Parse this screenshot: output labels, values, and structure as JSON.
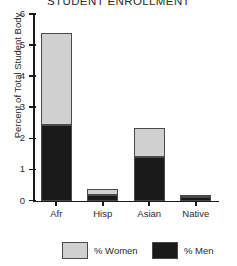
{
  "chart_data": {
    "type": "bar",
    "subtype": "stacked",
    "title": "STUDENT ENROLLMENT",
    "xlabel": "",
    "ylabel": "Percent of Total Student Body",
    "categories": [
      "Afr",
      "Hisp",
      "Asian",
      "Native"
    ],
    "series": [
      {
        "name": "% Men",
        "color": "#1a1a1a",
        "values": [
          2.43,
          0.19,
          1.41,
          0.12
        ]
      },
      {
        "name": "% Women",
        "color": "#d0d0d0",
        "values": [
          2.97,
          0.19,
          0.92,
          0.04
        ]
      }
    ],
    "totals": [
      5.4,
      0.38,
      2.33,
      0.16
    ],
    "stack_order": [
      "% Men",
      "% Women"
    ],
    "ylim": [
      0,
      6
    ],
    "yticks": [
      0,
      1,
      2,
      3,
      4,
      5,
      6
    ],
    "ytick_labels": [
      "0",
      "1",
      "2",
      "3",
      "4",
      "5",
      "6"
    ],
    "grid": false,
    "legend": {
      "position": "bottom",
      "entries": [
        {
          "label": "% Women",
          "color": "#d0d0d0"
        },
        {
          "label": "% Men",
          "color": "#1a1a1a"
        }
      ]
    }
  },
  "colors": {
    "women": "#d0d0d0",
    "men": "#1a1a1a",
    "axis": "#1a1a1a",
    "text": "#2b2b2b",
    "background": "#ffffff",
    "bar_edge": "#4a4a4a"
  }
}
